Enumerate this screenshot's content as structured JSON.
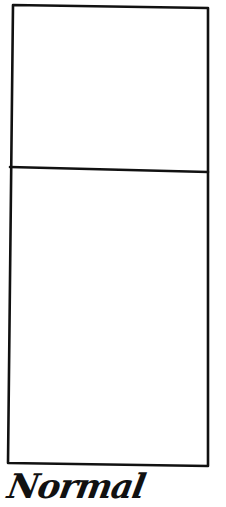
{
  "diagram": {
    "caption": "Normal",
    "shape": "tall rectangle divided into upper and lower compartments",
    "compartments": [
      {
        "name": "upper",
        "label": ""
      },
      {
        "name": "lower",
        "label": ""
      }
    ],
    "stroke_color": "#111111",
    "background": "#ffffff"
  }
}
